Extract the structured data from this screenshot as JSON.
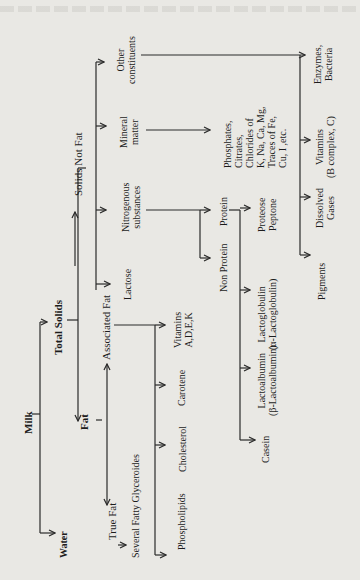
{
  "diagram": {
    "orientation": "rotated-90-ccw",
    "nodes": {
      "milk": "Milk",
      "water": "Water",
      "total_solids": "Total Solids",
      "fat": "Fat",
      "solids_not_fat": "Solids Not Fat",
      "associated_fat": "Associated Fat",
      "true_fat": "True Fat",
      "several_fatty_glycerides": "Several Fatty Glyceroides",
      "phospholipids": "Phospholipids",
      "cholesterol": "Cholesterol",
      "carotene": "Carotene",
      "vitamins_adek": [
        "Vitamins",
        "A,D,E,K"
      ],
      "lactose": "Lactose",
      "nitrogenous": [
        "Nitrogenous",
        "substances"
      ],
      "mineral_matter": [
        "Mineral",
        "matter"
      ],
      "other_constituents": [
        "Other",
        "constituents"
      ],
      "non_protein": "Non Protein",
      "protein": "Protein",
      "casein": "Casein",
      "lactoalbumin": [
        "Lactoalbumin",
        "(β-Lactoalbumin)"
      ],
      "lactoglobulin": [
        "Lactoglobulin",
        "(α-Lactoglobulin)"
      ],
      "proteose_peptone": [
        "Proteose",
        "Peptone"
      ],
      "minerals_list": [
        "Phosphates,",
        "Citrates,",
        "Chlorides of",
        "K, Na, Ca, Mg,",
        "Traces of Fe,",
        "Cu, I ,etc."
      ],
      "pigments": "Pigments",
      "dissolved_gases": [
        "Dissolved",
        "Gases"
      ],
      "vitamins_bc": [
        "Vitamins",
        "(B complex, C)"
      ],
      "enzymes_bacteria": [
        "Enzymes,",
        "Bacteria"
      ]
    },
    "edges": [
      [
        "Milk",
        "Water"
      ],
      [
        "Milk",
        "Total Solids"
      ],
      [
        "Total Solids",
        "Fat"
      ],
      [
        "Total Solids",
        "Solids Not Fat"
      ],
      [
        "Fat",
        "True Fat"
      ],
      [
        "Fat",
        "Associated Fat"
      ],
      [
        "True Fat",
        "Several Fatty Glyceroides"
      ],
      [
        "Associated Fat",
        "Phospholipids"
      ],
      [
        "Associated Fat",
        "Cholesterol"
      ],
      [
        "Associated Fat",
        "Carotene"
      ],
      [
        "Associated Fat",
        "Vitamins A,D,E,K"
      ],
      [
        "Solids Not Fat",
        "Lactose"
      ],
      [
        "Solids Not Fat",
        "Nitrogenous substances"
      ],
      [
        "Solids Not Fat",
        "Mineral matter"
      ],
      [
        "Solids Not Fat",
        "Other constituents"
      ],
      [
        "Nitrogenous substances",
        "Non Protein"
      ],
      [
        "Nitrogenous substances",
        "Protein"
      ],
      [
        "Protein",
        "Casein"
      ],
      [
        "Protein",
        "Lactoalbumin"
      ],
      [
        "Protein",
        "Lactoglobulin"
      ],
      [
        "Protein",
        "Proteose Peptone"
      ],
      [
        "Mineral matter",
        "Phosphates, Citrates, ..."
      ],
      [
        "Other constituents",
        "Pigments"
      ],
      [
        "Other constituents",
        "Dissolved Gases"
      ],
      [
        "Other constituents",
        "Vitamins (B complex, C)"
      ],
      [
        "Other constituents",
        "Enzymes, Bacteria"
      ]
    ]
  }
}
